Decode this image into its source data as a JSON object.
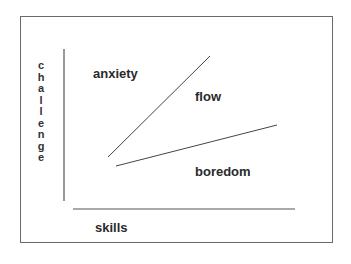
{
  "diagram": {
    "title": "",
    "y_axis_label": "challenge",
    "y_axis_letters": [
      "c",
      "h",
      "a",
      "l",
      "l",
      "e",
      "n",
      "g",
      "e"
    ],
    "x_axis_label": "skills",
    "regions": {
      "top_left": "anxiety",
      "middle": "flow",
      "bottom_right": "boredom"
    },
    "colors": {
      "line": "#444444",
      "text": "#2a2a2a",
      "frame": "#6a6a6a"
    }
  }
}
